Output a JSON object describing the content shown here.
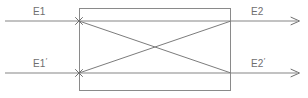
{
  "figure": {
    "type": "optical-coupler-diagram",
    "background_color": "#ffffff",
    "line_color": "#808080",
    "box_color": "#8a8a8a",
    "text_color": "#6e6e6e",
    "labels": {
      "input_top": "E1",
      "input_bottom_base": "E1",
      "input_bottom_prime": "′",
      "output_top": "E2",
      "output_bottom_base": "E2",
      "output_bottom_prime": "′"
    },
    "geometry": {
      "box": {
        "x": 79,
        "y": 8,
        "width": 152,
        "height": 83
      },
      "top_line_y": 21,
      "bottom_line_y": 73,
      "line_start_x": 5,
      "line_end_x": 300,
      "diagonal_1": {
        "x1": 79,
        "y1": 21,
        "x2": 231,
        "y2": 73
      },
      "diagonal_2": {
        "x1": 79,
        "y1": 73,
        "x2": 231,
        "y2": 21
      },
      "crossing_point": {
        "x": 155,
        "y": 47
      },
      "x_marker_top": {
        "x": 79,
        "y": 21
      },
      "x_marker_bottom": {
        "x": 79,
        "y": 73
      }
    }
  }
}
